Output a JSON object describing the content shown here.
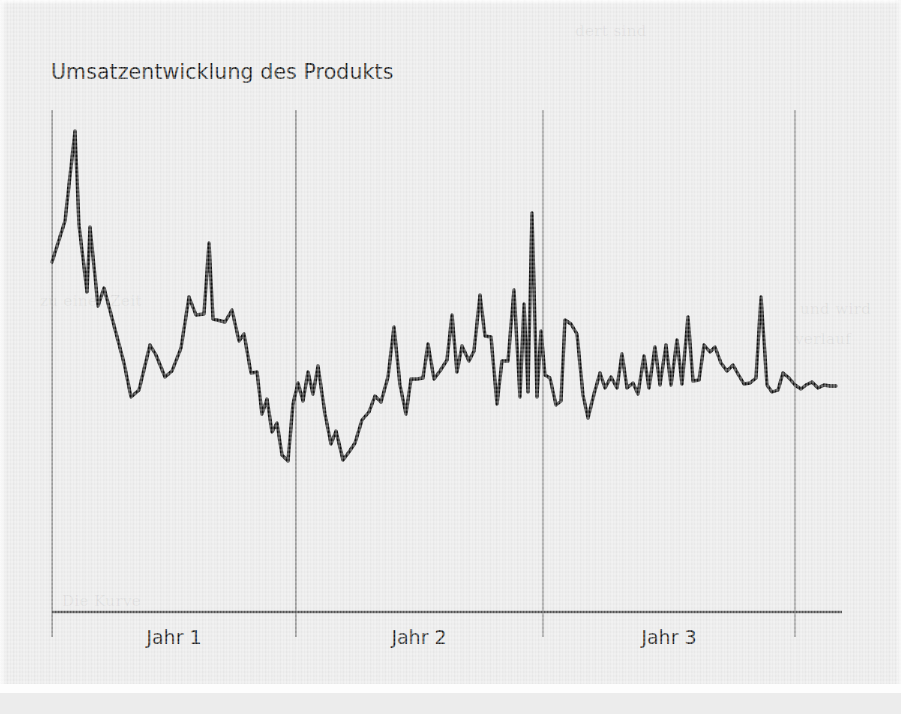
{
  "page": {
    "background_color": "#e9e9e9",
    "ink_color": "#111111",
    "gridline_color": "#6f6f6f",
    "axis_color": "#555555"
  },
  "chart": {
    "title": "Umsatzentwicklung des Produkts",
    "axis_labels": [
      "Jahr 1",
      "Jahr 2",
      "Jahr 3"
    ]
  },
  "ghost_text": {
    "top_right": "dert sind",
    "mid_left": "zu einer Zeit",
    "mid_right": "und wird",
    "low_left": "Die Kurve",
    "low_right": "verlauf"
  },
  "chart_data": {
    "type": "line",
    "title": "Umsatzentwicklung des Produkts",
    "xlabel": "",
    "ylabel": "",
    "grid": true,
    "legend": false,
    "axis": {
      "x_axis_y_px": 612,
      "x_axis_x0_px": 52,
      "x_axis_x1_px": 842,
      "y_axis_x_px": 52,
      "y_axis_top_px": 110,
      "gridlines_x_px": [
        52,
        296,
        543,
        795
      ],
      "gridline_top_px": 110,
      "gridline_bottom_px": 637
    },
    "categories": [
      "Jahr 1",
      "Jahr 2",
      "Jahr 3"
    ],
    "category_centers_px": [
      174,
      419,
      669
    ],
    "note": "Monthly-style sales series; values are pixel y-coordinates of the drawn polyline (lower y = higher sales).",
    "series": [
      {
        "name": "Umsatz",
        "color": "#111111",
        "line_width": 3.4,
        "points_px": [
          [
            52,
            262
          ],
          [
            65,
            221
          ],
          [
            75,
            131
          ],
          [
            79,
            225
          ],
          [
            87,
            292
          ],
          [
            90,
            227
          ],
          [
            98,
            306
          ],
          [
            104,
            288
          ],
          [
            124,
            363
          ],
          [
            131,
            397
          ],
          [
            139,
            390
          ],
          [
            150,
            345
          ],
          [
            156,
            355
          ],
          [
            165,
            377
          ],
          [
            172,
            371
          ],
          [
            181,
            348
          ],
          [
            189,
            297
          ],
          [
            196,
            315
          ],
          [
            204,
            314
          ],
          [
            209,
            243
          ],
          [
            213,
            319
          ],
          [
            225,
            322
          ],
          [
            232,
            310
          ],
          [
            239,
            341
          ],
          [
            244,
            334
          ],
          [
            251,
            373
          ],
          [
            257,
            372
          ],
          [
            262,
            414
          ],
          [
            267,
            399
          ],
          [
            272,
            432
          ],
          [
            277,
            423
          ],
          [
            282,
            455
          ],
          [
            288,
            461
          ],
          [
            293,
            404
          ],
          [
            298,
            383
          ],
          [
            303,
            401
          ],
          [
            308,
            372
          ],
          [
            313,
            394
          ],
          [
            318,
            366
          ],
          [
            325,
            414
          ],
          [
            331,
            444
          ],
          [
            336,
            431
          ],
          [
            343,
            460
          ],
          [
            349,
            452
          ],
          [
            355,
            443
          ],
          [
            362,
            420
          ],
          [
            369,
            412
          ],
          [
            375,
            396
          ],
          [
            381,
            402
          ],
          [
            388,
            377
          ],
          [
            394,
            327
          ],
          [
            400,
            385
          ],
          [
            406,
            414
          ],
          [
            411,
            379
          ],
          [
            417,
            379
          ],
          [
            423,
            378
          ],
          [
            428,
            344
          ],
          [
            434,
            379
          ],
          [
            440,
            371
          ],
          [
            447,
            360
          ],
          [
            452,
            315
          ],
          [
            457,
            372
          ],
          [
            462,
            346
          ],
          [
            469,
            361
          ],
          [
            474,
            351
          ],
          [
            480,
            295
          ],
          [
            485,
            336
          ],
          [
            491,
            337
          ],
          [
            497,
            404
          ],
          [
            502,
            361
          ],
          [
            508,
            361
          ],
          [
            514,
            290
          ],
          [
            520,
            397
          ],
          [
            524,
            304
          ],
          [
            528,
            392
          ],
          [
            532,
            213
          ],
          [
            537,
            397
          ],
          [
            541,
            331
          ],
          [
            545,
            375
          ],
          [
            550,
            378
          ],
          [
            556,
            405
          ],
          [
            561,
            401
          ],
          [
            565,
            320
          ],
          [
            571,
            324
          ],
          [
            577,
            334
          ],
          [
            583,
            395
          ],
          [
            588,
            418
          ],
          [
            594,
            394
          ],
          [
            600,
            373
          ],
          [
            605,
            388
          ],
          [
            611,
            377
          ],
          [
            617,
            388
          ],
          [
            622,
            354
          ],
          [
            627,
            388
          ],
          [
            633,
            383
          ],
          [
            638,
            394
          ],
          [
            644,
            356
          ],
          [
            649,
            388
          ],
          [
            655,
            347
          ],
          [
            660,
            385
          ],
          [
            666,
            345
          ],
          [
            671,
            385
          ],
          [
            677,
            340
          ],
          [
            682,
            384
          ],
          [
            688,
            317
          ],
          [
            693,
            381
          ],
          [
            699,
            380
          ],
          [
            704,
            345
          ],
          [
            710,
            352
          ],
          [
            715,
            347
          ],
          [
            721,
            363
          ],
          [
            727,
            371
          ],
          [
            733,
            365
          ],
          [
            738,
            374
          ],
          [
            744,
            384
          ],
          [
            750,
            383
          ],
          [
            756,
            378
          ],
          [
            761,
            297
          ],
          [
            767,
            385
          ],
          [
            772,
            392
          ],
          [
            778,
            390
          ],
          [
            783,
            373
          ],
          [
            789,
            378
          ],
          [
            795,
            385
          ],
          [
            801,
            389
          ],
          [
            806,
            385
          ],
          [
            812,
            382
          ],
          [
            818,
            388
          ],
          [
            824,
            385
          ],
          [
            830,
            386
          ],
          [
            836,
            386
          ]
        ]
      }
    ]
  }
}
